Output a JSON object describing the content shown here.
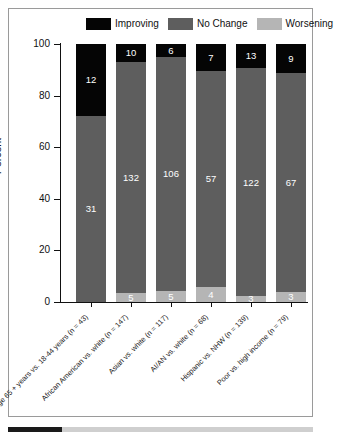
{
  "chart_data": {
    "type": "bar",
    "title": "",
    "xlabel": "",
    "ylabel": "Percent",
    "ylim": [
      0,
      100
    ],
    "yticks": [
      0,
      20,
      40,
      60,
      80,
      100
    ],
    "grid": false,
    "stacked": true,
    "stack_mode": "percent",
    "legend_position": "top-center",
    "categories": [
      "Age 65 + years vs. 18-44 years (n = 43)",
      "African American vs. white (n = 147)",
      "Asian vs. white (n = 117)",
      "AI/AN vs. white (n = 68)",
      "Hispanic vs. NHW (n = 139)",
      "Poor vs. high income (n = 79)"
    ],
    "series": [
      {
        "name": "Improving",
        "color": "#050505",
        "values": [
          12,
          10,
          6,
          7,
          13,
          9
        ]
      },
      {
        "name": "No Change",
        "color": "#5e5e5e",
        "values": [
          31,
          132,
          106,
          57,
          122,
          67
        ]
      },
      {
        "name": "Worsening",
        "color": "#b5b5b5",
        "values": [
          0,
          5,
          5,
          4,
          3,
          3
        ]
      }
    ],
    "totals": [
      43,
      147,
      117,
      68,
      138,
      79
    ],
    "percents": {
      "Improving": [
        27.9,
        6.8,
        5.1,
        10.3,
        9.4,
        11.4
      ],
      "No Change": [
        72.1,
        89.8,
        90.6,
        83.8,
        88.4,
        84.8
      ],
      "Worsening": [
        0,
        3.4,
        4.3,
        5.9,
        2.2,
        3.8
      ]
    }
  },
  "legend": {
    "items": [
      {
        "label": "Improving",
        "color": "#050505"
      },
      {
        "label": "No Change",
        "color": "#5e5e5e"
      },
      {
        "label": "Worsening",
        "color": "#b5b5b5"
      }
    ]
  },
  "axes": {
    "y_title": "Percent",
    "y_ticks": [
      "100",
      "80",
      "60",
      "40",
      "20",
      "0"
    ]
  },
  "bar_labels": {
    "improving": [
      "12",
      "10",
      "6",
      "7",
      "13",
      "9"
    ],
    "no_change": [
      "31",
      "132",
      "106",
      "57",
      "122",
      "67"
    ],
    "worsening": [
      "",
      "5",
      "5",
      "4",
      "3",
      "3"
    ]
  },
  "x_labels": [
    "Age 65 + years vs. 18-44 years (n = 43)",
    "African American vs. white (n = 147)",
    "Asian vs. white (n = 117)",
    "AI/AN vs. white (n = 68)",
    "Hispanic vs. NHW (n = 139)",
    "Poor vs. high income (n = 79)"
  ]
}
